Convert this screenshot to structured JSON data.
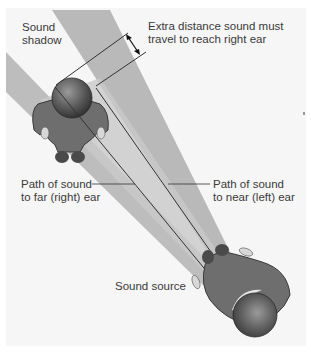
{
  "figure": {
    "labels": {
      "sound_shadow": [
        "Sound",
        "shadow"
      ],
      "extra_distance": [
        "Extra distance sound must",
        "travel to reach right ear"
      ],
      "far_path": [
        "Path of sound",
        "to far (right) ear"
      ],
      "near_path": [
        "Path of sound",
        "to near (left) ear"
      ],
      "sound_source": "Sound source"
    },
    "colors": {
      "background": "#f6f6f6",
      "shadow_beam": "#b9b9b9",
      "sound_beam": "#c4c4c4",
      "body": "#6e6e6e",
      "head": "#5a5a5a",
      "line": "#333333",
      "text": "#3a3a3a"
    }
  }
}
